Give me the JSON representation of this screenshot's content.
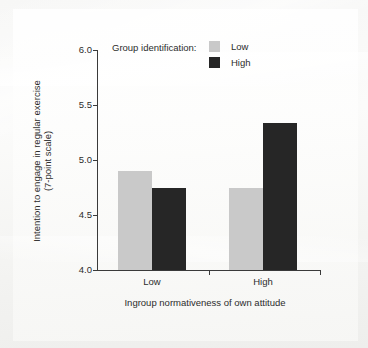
{
  "chart_data": {
    "type": "bar",
    "title": "",
    "subtitle": "",
    "xlabel": "Ingroup normativeness of own attitude",
    "ylabel": "Intention to engage in regular exercise (7-point scale)",
    "ylabel_line1": "Intention to engage in regular exercise",
    "ylabel_line2": "(7-point scale)",
    "categories": [
      "Low",
      "High"
    ],
    "series": [
      {
        "name": "Low",
        "values": [
          4.9,
          4.75
        ],
        "color": "#c9c9c9"
      },
      {
        "name": "High",
        "values": [
          4.75,
          5.34
        ],
        "color": "#262626"
      }
    ],
    "legend_title": "Group identification:",
    "legend_position": "top-center",
    "ylim": [
      4.0,
      6.0
    ],
    "yticks": [
      "4.0",
      "4.5",
      "5.0",
      "5.5",
      "6.0"
    ],
    "ytick_values": [
      4.0,
      4.5,
      5.0,
      5.5,
      6.0
    ],
    "grid": false
  },
  "axis": {
    "y_labels": [
      "6.0",
      "5.5",
      "5.0",
      "4.5",
      "4.0"
    ],
    "x_labels": [
      "Low",
      "High"
    ]
  },
  "legend": {
    "title": "Group identification:",
    "entries": [
      {
        "label": "Low",
        "color": "#c9c9c9"
      },
      {
        "label": "High",
        "color": "#262626"
      }
    ]
  },
  "colors": {
    "low_group": "#c9c9c9",
    "high_group": "#262626",
    "axis": "#3a3a3a",
    "text": "#2c2c2c",
    "background": "#f7f7f6"
  }
}
